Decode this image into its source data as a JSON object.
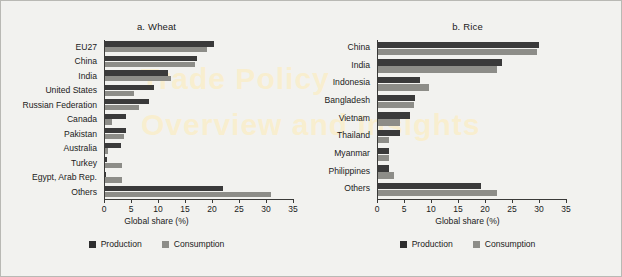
{
  "figure": {
    "background_color": "#f2f2ef",
    "border_color": "#b9b9b4",
    "watermark_line1": "Trade Policy",
    "watermark_line2": "Overview and Insights"
  },
  "legend": {
    "production_label": "Production",
    "consumption_label": "Consumption",
    "production_color": "#2e2e2e",
    "consumption_color": "#8d8d88",
    "position": "bottom-center"
  },
  "chart_data": [
    {
      "type": "bar",
      "orientation": "horizontal",
      "panel_number": "a.",
      "title": "Wheat",
      "xlabel": "Global share (%)",
      "ylabel": "",
      "xlim": [
        0,
        35
      ],
      "xticks": [
        0,
        5,
        10,
        15,
        20,
        25,
        30,
        35
      ],
      "xtick_labels": [
        "0",
        "5",
        "10",
        "15",
        "20",
        "25",
        "30",
        "35"
      ],
      "grid": false,
      "categories": [
        "EU27",
        "China",
        "India",
        "United States",
        "Russian Federation",
        "Canada",
        "Pakistan",
        "Australia",
        "Turkey",
        "Egypt, Arab Rep.",
        "Others"
      ],
      "series": [
        {
          "name": "Production",
          "color": "#3a3a3a",
          "values": [
            20.2,
            17.1,
            11.7,
            9.1,
            8.1,
            3.9,
            3.9,
            3.0,
            0.3,
            0.1,
            21.8
          ]
        },
        {
          "name": "Consumption",
          "color": "#8d8d88",
          "values": [
            18.9,
            16.7,
            12.2,
            5.4,
            6.3,
            1.3,
            3.5,
            0.5,
            3.1,
            3.1,
            30.8
          ]
        }
      ]
    },
    {
      "type": "bar",
      "orientation": "horizontal",
      "panel_number": "b.",
      "title": "Rice",
      "xlabel": "Global share (%)",
      "ylabel": "",
      "xlim": [
        0,
        35
      ],
      "xticks": [
        0,
        5,
        10,
        15,
        20,
        25,
        30,
        35
      ],
      "xtick_labels": [
        "0",
        "5",
        "10",
        "15",
        "20",
        "25",
        "30",
        "35"
      ],
      "grid": false,
      "categories": [
        "China",
        "India",
        "Indonesia",
        "Bangladesh",
        "Vietnam",
        "Thailand",
        "Myanmar",
        "Philippines",
        "Others"
      ],
      "series": [
        {
          "name": "Production",
          "color": "#3a3a3a",
          "values": [
            29.9,
            23.0,
            7.8,
            6.8,
            5.9,
            4.0,
            2.0,
            2.0,
            19.0
          ]
        },
        {
          "name": "Consumption",
          "color": "#8d8d88",
          "values": [
            29.4,
            22.1,
            9.4,
            6.6,
            4.1,
            2.1,
            2.1,
            3.0,
            22.0
          ]
        }
      ]
    }
  ]
}
